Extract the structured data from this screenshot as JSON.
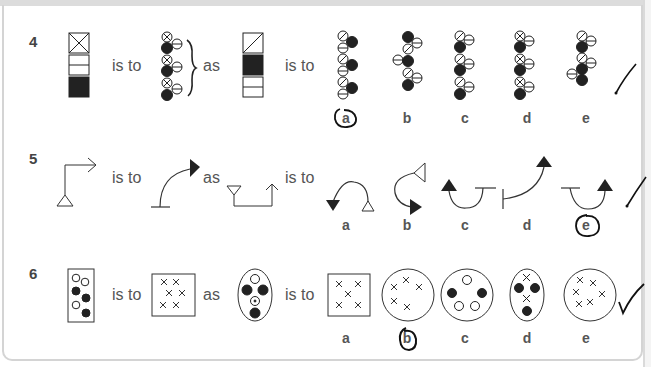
{
  "questions": [
    {
      "number": "4",
      "connector_1": "is to",
      "connector_2": "as",
      "connector_3": "is to",
      "options": [
        "a",
        "b",
        "c",
        "d",
        "e"
      ],
      "circled_answer": "a",
      "mark": "tick"
    },
    {
      "number": "5",
      "connector_1": "is to",
      "connector_2": "as",
      "connector_3": "is to",
      "options": [
        "a",
        "b",
        "c",
        "d",
        "e"
      ],
      "circled_answer": "e",
      "mark": "tick"
    },
    {
      "number": "6",
      "connector_1": "is to",
      "connector_2": "as",
      "connector_3": "is to",
      "options": [
        "a",
        "b",
        "c",
        "d",
        "e"
      ],
      "circled_answer": "b",
      "mark": "tick"
    }
  ],
  "colors": {
    "ink": "#222222",
    "text": "#555555",
    "frame": "#d4d4d4",
    "background": "#ffffff"
  }
}
